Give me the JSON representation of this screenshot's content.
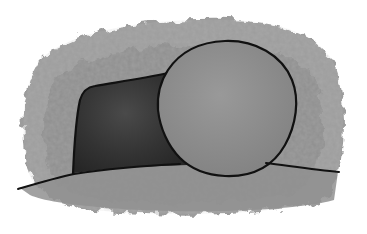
{
  "illustration": {
    "subject": "empty tomb with rolled-away stone",
    "style": "watercolor grayscale with black ink outlines",
    "colors": {
      "background": "#ffffff",
      "wash_outer": "#9a9a9a",
      "wash_inner": "#8a8a8a",
      "tomb_interior": "#3a3a3a",
      "stone": "#8c8c8c",
      "ground": "#8e8e8e",
      "outline": "#111111"
    }
  }
}
